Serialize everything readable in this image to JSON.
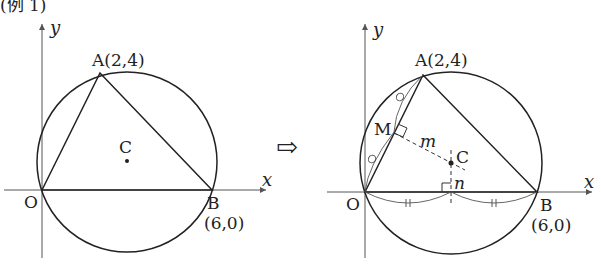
{
  "header": {
    "label": "(例 1)"
  },
  "arrow": {
    "symbol": "⇨"
  },
  "left_figure": {
    "axis_x": "x",
    "axis_y": "y",
    "points": {
      "O": {
        "label": "O",
        "coord": [
          0,
          0
        ]
      },
      "A": {
        "label": "A(2,4)",
        "coord": [
          2,
          4
        ]
      },
      "B": {
        "label": "B",
        "coord_label": "(6,0)",
        "coord": [
          6,
          0
        ]
      },
      "C": {
        "label": "C",
        "coord": [
          3,
          1
        ]
      }
    }
  },
  "right_figure": {
    "axis_x": "x",
    "axis_y": "y",
    "points": {
      "O": {
        "label": "O"
      },
      "A": {
        "label": "A(2,4)"
      },
      "B": {
        "label": "B",
        "coord_label": "(6,0)"
      },
      "C": {
        "label": "C"
      },
      "M": {
        "label": "M"
      }
    },
    "lines": {
      "m": "m",
      "n": "n"
    },
    "equal_marks": {
      "circle": "∘",
      "double_tick": "॥"
    }
  },
  "colors": {
    "stroke": "#222222",
    "dashed": "#333333",
    "axis": "#555555"
  }
}
